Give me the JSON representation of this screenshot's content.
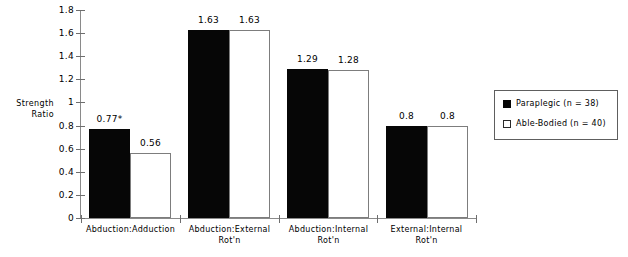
{
  "chart_data": {
    "type": "bar",
    "title": "",
    "xlabel": "",
    "ylabel": "Strength Ratio",
    "ylabel_lines": [
      "Strength",
      "Ratio"
    ],
    "ylim": [
      0,
      1.8
    ],
    "yticks": [
      "0",
      "0.2",
      "0.4",
      "0.6",
      "0.8",
      "1",
      "1.2",
      "1.4",
      "1.6",
      "1.8"
    ],
    "ytick_values": [
      0,
      0.2,
      0.4,
      0.6,
      0.8,
      1,
      1.2,
      1.4,
      1.6,
      1.8
    ],
    "grid": false,
    "legend_position": "right",
    "categories": [
      "Abduction:Adduction",
      "Abduction:External Rot'n",
      "Abduction:Internal Rot'n",
      "External:Internal Rot'n"
    ],
    "category_lines": [
      [
        "Abduction:Adduction",
        ""
      ],
      [
        "Abduction:External",
        "Rot'n"
      ],
      [
        "Abduction:Internal",
        "Rot'n"
      ],
      [
        "External:Internal",
        "Rot'n"
      ]
    ],
    "series": [
      {
        "name": "Paraplegic (n = 38)",
        "color": "#060606",
        "values": [
          0.77,
          1.63,
          1.29,
          0.8
        ],
        "labels": [
          "0.77*",
          "1.63",
          "1.29",
          "0.8"
        ]
      },
      {
        "name": "Able-Bodied (n = 40)",
        "color": "#ffffff",
        "values": [
          0.56,
          1.63,
          1.28,
          0.8
        ],
        "labels": [
          "0.56",
          "1.63",
          "1.28",
          "0.8"
        ]
      }
    ],
    "annotations": [
      "* denotes significant difference"
    ]
  },
  "axis": {
    "ylabel_line1": "Strength",
    "ylabel_line2": "Ratio"
  },
  "legend": {
    "items": [
      {
        "label": "Paraplegic (n = 38)",
        "swatch": "dark"
      },
      {
        "label": "Able-Bodied (n = 40)",
        "swatch": "light"
      }
    ]
  }
}
